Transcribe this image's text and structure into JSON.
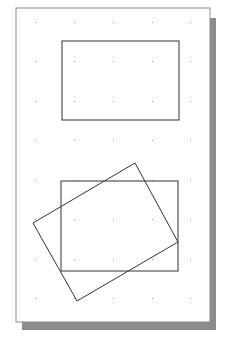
{
  "diagram": {
    "page": {
      "x": 16,
      "y": 8,
      "w": 194,
      "h": 314,
      "fill": "#ffffff",
      "stroke": "#8a8a8a"
    },
    "shadow": {
      "x": 22,
      "y": 18,
      "w": 194,
      "h": 312,
      "fill": "#8c8c8c"
    },
    "grid": {
      "xs": [
        35,
        74,
        113,
        152,
        190
      ],
      "ys": [
        22,
        61,
        101,
        140,
        180,
        219,
        259,
        298
      ],
      "color": "#9a9a9a"
    },
    "rect_top": {
      "x": 62,
      "y": 41,
      "w": 117,
      "h": 79,
      "stroke": "#333333"
    },
    "rect_bottom": {
      "x": 61,
      "y": 181,
      "w": 117,
      "h": 90,
      "stroke": "#333333"
    },
    "rotated_rect": {
      "points": "135,163 178,242 77,301 33,223",
      "stroke": "#333333"
    }
  }
}
